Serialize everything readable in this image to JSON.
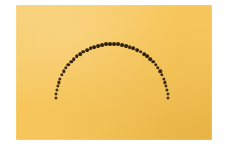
{
  "canvas": {
    "width": 225,
    "height": 149,
    "background_color": "#ffffff"
  },
  "card": {
    "label": "orange-card",
    "x": 16,
    "y": 5,
    "width": 196,
    "height": 135,
    "fill_color": "#f5c council",
    "color": "#f6c65a",
    "color_light": "#f9cf74",
    "color_dark": "#edb949"
  },
  "figure": {
    "label": "dotted-semicircular-arc",
    "shape": "arc",
    "dot_color": "#3a2a12",
    "dot_color_core": "#241a0c",
    "center_x": 112,
    "center_y": 100,
    "radius": 56,
    "start_angle_deg": 178,
    "end_angle_deg": 2,
    "dot_count": 44,
    "dot_diameter": 3.3,
    "dot_diameter_top": 3.9
  },
  "chart_data": {
    "type": "scatter",
    "title": "",
    "xlabel": "",
    "ylabel": "",
    "legend": [],
    "grid": false,
    "xlim": [
      0,
      225
    ],
    "ylim": [
      0,
      149
    ],
    "series": [
      {
        "name": "arc-dots",
        "marker": "filled-circle",
        "color": "#3a2a12",
        "x": [
          56.0,
          56.3,
          57.3,
          58.9,
          61.1,
          64.0,
          67.4,
          71.4,
          75.9,
          80.9,
          86.3,
          92.0,
          98.0,
          104.2,
          110.6,
          117.1,
          123.6,
          130.0,
          136.3,
          142.4,
          148.2,
          153.7,
          158.8,
          163.5,
          167.6,
          171.2,
          174.2,
          176.6,
          178.4,
          179.5,
          180.0
        ],
        "y": [
          100.0,
          95.1,
          90.3,
          85.5,
          80.9,
          76.5,
          72.3,
          68.4,
          64.8,
          61.5,
          58.6,
          56.1,
          54.0,
          52.3,
          51.1,
          50.3,
          50.0,
          50.2,
          50.8,
          51.9,
          53.5,
          55.5,
          57.9,
          60.8,
          64.0,
          67.6,
          71.4,
          75.5,
          79.8,
          84.3,
          88.9
        ]
      }
    ]
  }
}
